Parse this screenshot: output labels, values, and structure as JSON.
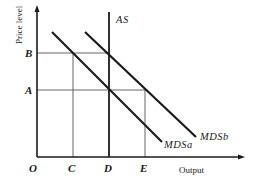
{
  "diagram": {
    "type": "economics-aggregate-supply-demand",
    "y_axis_title": "Price level",
    "x_axis_title": "Output",
    "origin_label": "O",
    "price_labels": {
      "B": "B",
      "A": "A"
    },
    "output_labels": {
      "C": "C",
      "D": "D",
      "E": "E"
    },
    "curves": [
      {
        "id": "AS",
        "label": "AS",
        "kind": "vertical"
      },
      {
        "id": "MDSa",
        "label": "MDSa",
        "kind": "downward-sloping"
      },
      {
        "id": "MDSb",
        "label": "MDSb",
        "kind": "downward-sloping"
      }
    ],
    "colors": {
      "ink": "#1a1a1a",
      "guide": "#555555",
      "background": "#ffffff"
    }
  }
}
